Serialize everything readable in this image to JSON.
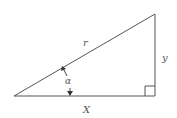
{
  "diagram": {
    "type": "right-triangle",
    "labels": {
      "hypotenuse": "r",
      "opposite": "y",
      "adjacent": "X",
      "angle": "α"
    },
    "vertices": {
      "origin": [
        14,
        96
      ],
      "right_angle": [
        155,
        96
      ],
      "top": [
        155,
        14
      ]
    },
    "colors": {
      "stroke": "#555555",
      "background": "#ffffff"
    }
  }
}
